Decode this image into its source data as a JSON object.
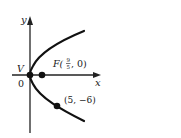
{
  "diagram": {
    "type": "parabola",
    "equation_implied": "y^2 = (36/5) x",
    "axes": {
      "x_label": "x",
      "y_label": "y",
      "origin_label": "0"
    },
    "points": [
      {
        "name": "vertex",
        "label": "V",
        "coords": [
          0,
          0
        ]
      },
      {
        "name": "focus",
        "label_prefix": "F(",
        "frac_num": "9",
        "frac_den": "5",
        "label_suffix": ", 0)",
        "coords": [
          1.8,
          0
        ]
      },
      {
        "name": "point",
        "label": "(5, −6)",
        "coords": [
          5,
          -6
        ]
      }
    ],
    "colors": {
      "curve": "#111111",
      "axes": "#222222",
      "text": "#1a1a1a"
    }
  }
}
